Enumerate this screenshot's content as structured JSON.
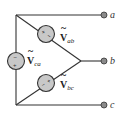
{
  "diagram": {
    "type": "delta-connected voltage sources",
    "terminals": [
      {
        "id": "a",
        "label": "a"
      },
      {
        "id": "b",
        "label": "b"
      },
      {
        "id": "c",
        "label": "c"
      }
    ],
    "sources": [
      {
        "id": "ab",
        "symbol": "V",
        "subscript": "ab",
        "polarity_plus": "+",
        "polarity_minus": "−"
      },
      {
        "id": "bc",
        "symbol": "V",
        "subscript": "bc",
        "polarity_plus": "+",
        "polarity_minus": "−"
      },
      {
        "id": "ca",
        "symbol": "V",
        "subscript": "ca",
        "polarity_plus": "+",
        "polarity_minus": "−"
      }
    ],
    "colors": {
      "wire": "#333333",
      "source_fill": "#c8c8c8",
      "terminal_fill": "#8a8a8a"
    }
  }
}
